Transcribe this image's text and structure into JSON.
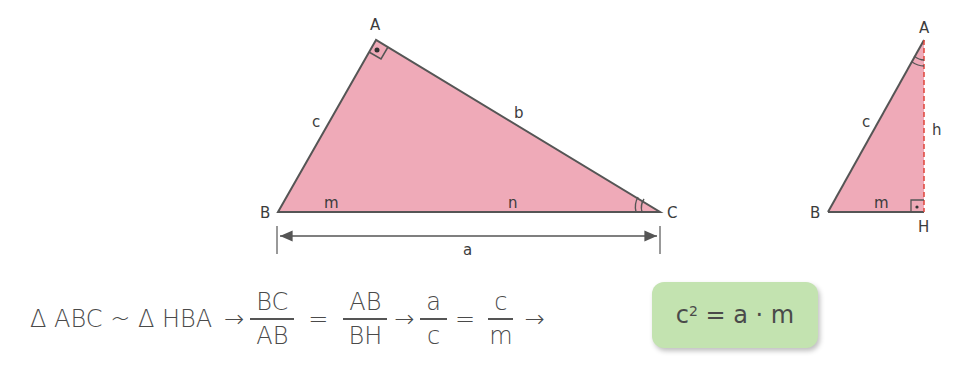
{
  "colors": {
    "triangle_fill": "#efaab8",
    "stroke": "#555555",
    "height_line": "#e0443a",
    "result_box": "#c3e3b0"
  },
  "main_triangle": {
    "vertices": {
      "A": "A",
      "B": "B",
      "C": "C"
    },
    "sides": {
      "c": "c",
      "b": "b",
      "a": "a"
    },
    "segments": {
      "m": "m",
      "n": "n"
    },
    "right_angle_at": "A",
    "marked_angle_at": "C"
  },
  "small_triangle": {
    "vertices": {
      "A": "A",
      "B": "B",
      "H": "H"
    },
    "sides": {
      "c": "c",
      "h": "h",
      "m": "m"
    },
    "right_angle_at": "H",
    "marked_angle_at": "A"
  },
  "formula": {
    "similarity": "Δ ABC ~ Δ HBA",
    "arrow": "→",
    "equals": "=",
    "frac1": {
      "num": "BC",
      "den": "AB"
    },
    "frac2": {
      "num": "AB",
      "den": "BH"
    },
    "frac3": {
      "num": "a",
      "den": "c"
    },
    "frac4": {
      "num": "c",
      "den": "m"
    }
  },
  "result": {
    "base": "c",
    "exponent": "2",
    "rhs": " = a · m"
  }
}
